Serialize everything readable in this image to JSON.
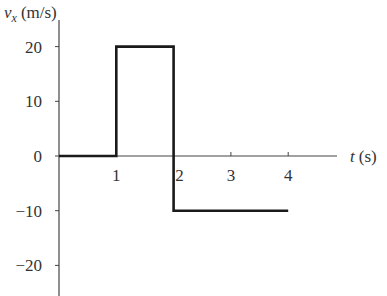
{
  "chart_data": {
    "type": "line",
    "title": "",
    "xlabel": "t (s)",
    "ylabel": "v_x (m/s)",
    "ylabel_parts": {
      "var": "v",
      "sub": "x",
      "unit": "(m/s)"
    },
    "xlabel_parts": {
      "var": "t",
      "unit": "(s)"
    },
    "x_ticks": [
      1,
      2,
      3,
      4
    ],
    "y_ticks": [
      20,
      10,
      0,
      -10,
      -20
    ],
    "y_tick_labels": [
      "20",
      "10",
      "0",
      "−10",
      "−20"
    ],
    "xlim": [
      0,
      4.9
    ],
    "ylim": [
      -24.5,
      25
    ],
    "grid": false,
    "legend": null,
    "series": [
      {
        "name": "v_x",
        "x": [
          0,
          1,
          1,
          2,
          2,
          4
        ],
        "y": [
          0,
          0,
          20,
          20,
          -10,
          -10
        ]
      }
    ]
  }
}
